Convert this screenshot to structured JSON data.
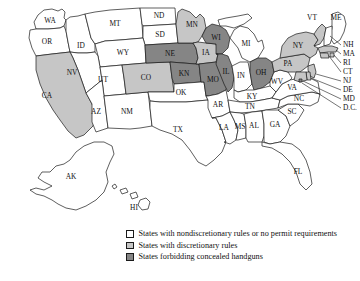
{
  "figure": {
    "type": "choropleth-map",
    "region": "United States",
    "background_color": "#ffffff",
    "border_color": "#1a1a1a"
  },
  "categories": [
    {
      "key": "nondiscretionary",
      "label": "States with nondiscretionary rules or no permit requirements",
      "color": "#ffffff"
    },
    {
      "key": "discretionary",
      "label": "States with discretionary rules",
      "color": "#c6c6c6"
    },
    {
      "key": "forbidding",
      "label": "States forbidding concealed handguns",
      "color": "#858585"
    }
  ],
  "states": [
    {
      "code": "WA",
      "category": "nondiscretionary"
    },
    {
      "code": "OR",
      "category": "nondiscretionary"
    },
    {
      "code": "ID",
      "category": "nondiscretionary"
    },
    {
      "code": "MT",
      "category": "nondiscretionary"
    },
    {
      "code": "ND",
      "category": "nondiscretionary"
    },
    {
      "code": "SD",
      "category": "nondiscretionary"
    },
    {
      "code": "WY",
      "category": "nondiscretionary"
    },
    {
      "code": "NV",
      "category": "nondiscretionary"
    },
    {
      "code": "UT",
      "category": "nondiscretionary"
    },
    {
      "code": "CA",
      "category": "discretionary"
    },
    {
      "code": "AZ",
      "category": "nondiscretionary"
    },
    {
      "code": "NM",
      "category": "nondiscretionary"
    },
    {
      "code": "CO",
      "category": "discretionary"
    },
    {
      "code": "NE",
      "category": "forbidding"
    },
    {
      "code": "KN",
      "category": "forbidding"
    },
    {
      "code": "OK",
      "category": "nondiscretionary"
    },
    {
      "code": "TX",
      "category": "nondiscretionary"
    },
    {
      "code": "MN",
      "category": "discretionary"
    },
    {
      "code": "IA",
      "category": "discretionary"
    },
    {
      "code": "MO",
      "category": "forbidding"
    },
    {
      "code": "AR",
      "category": "nondiscretionary"
    },
    {
      "code": "LA",
      "category": "nondiscretionary"
    },
    {
      "code": "WI",
      "category": "forbidding"
    },
    {
      "code": "IL",
      "category": "forbidding"
    },
    {
      "code": "MI",
      "category": "nondiscretionary"
    },
    {
      "code": "IN",
      "category": "nondiscretionary"
    },
    {
      "code": "OH",
      "category": "forbidding"
    },
    {
      "code": "KY",
      "category": "nondiscretionary"
    },
    {
      "code": "TN",
      "category": "nondiscretionary"
    },
    {
      "code": "MS",
      "category": "nondiscretionary"
    },
    {
      "code": "AL",
      "category": "nondiscretionary"
    },
    {
      "code": "GA",
      "category": "nondiscretionary"
    },
    {
      "code": "FL",
      "category": "nondiscretionary"
    },
    {
      "code": "SC",
      "category": "nondiscretionary"
    },
    {
      "code": "NC",
      "category": "nondiscretionary"
    },
    {
      "code": "VA",
      "category": "nondiscretionary"
    },
    {
      "code": "WV",
      "category": "nondiscretionary"
    },
    {
      "code": "PA",
      "category": "discretionary"
    },
    {
      "code": "NY",
      "category": "discretionary"
    },
    {
      "code": "VT",
      "category": "discretionary"
    },
    {
      "code": "ME",
      "category": "nondiscretionary"
    },
    {
      "code": "NH",
      "category": "nondiscretionary"
    },
    {
      "code": "MA",
      "category": "discretionary"
    },
    {
      "code": "RI",
      "category": "discretionary"
    },
    {
      "code": "CT",
      "category": "discretionary"
    },
    {
      "code": "NJ",
      "category": "discretionary"
    },
    {
      "code": "DE",
      "category": "discretionary"
    },
    {
      "code": "MD",
      "category": "discretionary"
    },
    {
      "code": "D.C.",
      "category": "forbidding"
    },
    {
      "code": "AK",
      "category": "nondiscretionary"
    },
    {
      "code": "HI",
      "category": "nondiscretionary"
    }
  ],
  "labels": {
    "WA": "WA",
    "OR": "OR",
    "ID": "ID",
    "MT": "MT",
    "ND": "ND",
    "SD": "SD",
    "WY": "WY",
    "NV": "NV",
    "UT": "UT",
    "CA": "CA",
    "AZ": "AZ",
    "NM": "NM",
    "CO": "CO",
    "NE": "NE",
    "KN": "KN",
    "OK": "OK",
    "TX": "TX",
    "MN": "MN",
    "IA": "IA",
    "MO": "MO",
    "AR": "AR",
    "LA": "LA",
    "WI": "WI",
    "IL": "IL",
    "MI": "MI",
    "IN": "IN",
    "OH": "OH",
    "KY": "KY",
    "TN": "TN",
    "MS": "MS",
    "AL": "AL",
    "GA": "GA",
    "FL": "FL",
    "SC": "SC",
    "NC": "NC",
    "VA": "VA",
    "WV": "WV",
    "PA": "PA",
    "NY": "NY",
    "VT": "VT",
    "ME": "ME",
    "NH": "NH",
    "MA": "MA",
    "RI": "RI",
    "CT": "CT",
    "NJ": "NJ",
    "DE": "DE",
    "MD": "MD",
    "DC": "D.C.",
    "AK": "AK",
    "HI": "HI"
  }
}
